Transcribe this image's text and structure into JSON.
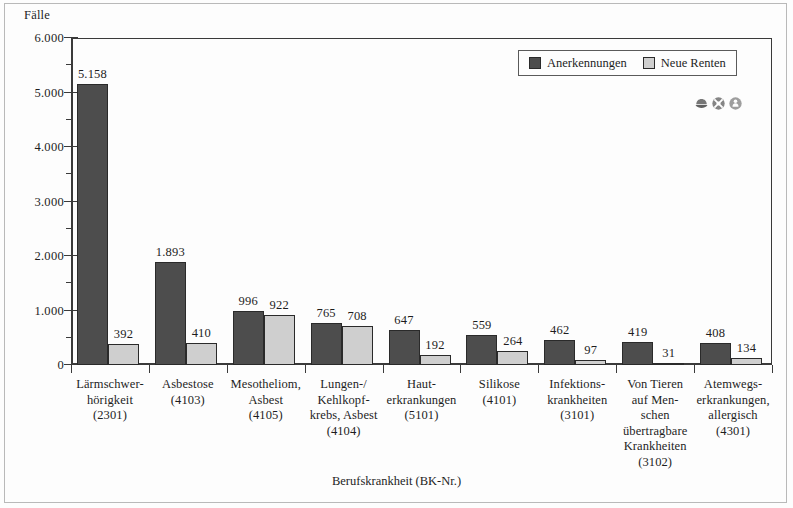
{
  "chart_data": {
    "type": "bar",
    "title": "",
    "ylabel": "Fälle",
    "xlabel": "Berufskrankheit (BK-Nr.)",
    "ylim": [
      0,
      6000
    ],
    "ytick_labels": [
      "0",
      "1.000",
      "2.000",
      "3.000",
      "4.000",
      "5.000",
      "6.000"
    ],
    "ytick_values": [
      0,
      1000,
      2000,
      3000,
      4000,
      5000,
      6000
    ],
    "minor_tick_step": 500,
    "grid": false,
    "legend_position": "top-right",
    "categories": [
      "Lärmschwer-\nhörigkeit\n(2301)",
      "Asbestose\n(4103)",
      "Mesotheliom,\nAsbest\n(4105)",
      "Lungen-/\nKehlkopf-\nkrebs, Asbest\n(4104)",
      "Haut-\nerkrankungen\n(5101)",
      "Silikose\n(4101)",
      "Infektions-\nkrankheiten\n(3101)",
      "Von Tieren\nauf Men-\nschen\nübertragbare\nKrankheiten\n(3102)",
      "Atemwegs-\nerkrankungen,\nallergisch\n(4301)"
    ],
    "series": [
      {
        "name": "Anerkennungen",
        "color": "#4d4d4d",
        "values": [
          5158,
          1893,
          996,
          765,
          647,
          559,
          462,
          419,
          408
        ],
        "labels": [
          "5.158",
          "1.893",
          "996",
          "765",
          "647",
          "559",
          "462",
          "419",
          "408"
        ]
      },
      {
        "name": "Neue Renten",
        "color": "#cfcfcf",
        "values": [
          392,
          410,
          922,
          708,
          192,
          264,
          97,
          31,
          134
        ],
        "labels": [
          "392",
          "410",
          "922",
          "708",
          "192",
          "264",
          "97",
          "31",
          "134"
        ]
      }
    ]
  },
  "watermark": {
    "icons": [
      "hand-shield-icon",
      "crossed-tools-icon",
      "person-badge-icon"
    ]
  }
}
